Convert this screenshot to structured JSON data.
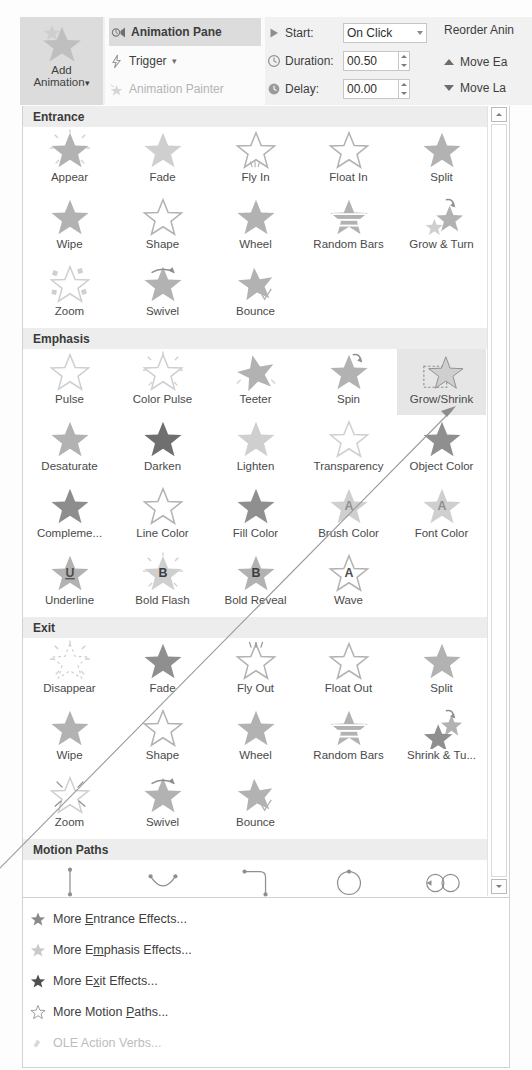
{
  "ribbon": {
    "add_animation": {
      "label_line1": "Add",
      "label_line2": "Animation",
      "icon": "add-animation-star-icon",
      "dropdown": "▾"
    },
    "commands": [
      {
        "label": "Animation Pane",
        "icon": "animation-pane-icon",
        "state": "active"
      },
      {
        "label": "Trigger",
        "icon": "trigger-lightning-icon",
        "dropdown": "▾",
        "state": "normal"
      },
      {
        "label": "Animation Painter",
        "icon": "animation-painter-icon",
        "state": "disabled"
      }
    ],
    "timing": {
      "start": {
        "label": "Start:",
        "value": "On Click",
        "icon": "play-triangle-icon",
        "dropdown": "▾"
      },
      "duration": {
        "label": "Duration:",
        "value": "00.50",
        "icon": "clock-icon"
      },
      "delay": {
        "label": "Delay:",
        "value": "00.00",
        "icon": "clock-delay-icon"
      }
    },
    "reorder": {
      "title": "Reorder Anin",
      "move_earlier": {
        "label": "Move Ea",
        "icon": "move-earlier-up-icon"
      },
      "move_later": {
        "label": "Move La",
        "icon": "move-later-down-icon"
      }
    }
  },
  "gallery": {
    "scrollbar": {
      "up_icon": "scroll-up-arrow-icon",
      "down_icon": "scroll-down-arrow-icon"
    },
    "sections": [
      {
        "title": "Entrance",
        "items": [
          {
            "label": "Appear",
            "icon": "star-appear-icon"
          },
          {
            "label": "Fade",
            "icon": "star-fade-icon"
          },
          {
            "label": "Fly In",
            "icon": "star-fly-in-icon"
          },
          {
            "label": "Float In",
            "icon": "star-float-in-icon"
          },
          {
            "label": "Split",
            "icon": "star-split-icon"
          },
          {
            "label": "Wipe",
            "icon": "star-wipe-icon"
          },
          {
            "label": "Shape",
            "icon": "star-shape-icon"
          },
          {
            "label": "Wheel",
            "icon": "star-wheel-icon"
          },
          {
            "label": "Random Bars",
            "icon": "star-random-bars-icon"
          },
          {
            "label": "Grow & Turn",
            "icon": "star-grow-turn-icon"
          },
          {
            "label": "Zoom",
            "icon": "star-zoom-icon"
          },
          {
            "label": "Swivel",
            "icon": "star-swivel-icon"
          },
          {
            "label": "Bounce",
            "icon": "star-bounce-icon"
          }
        ]
      },
      {
        "title": "Emphasis",
        "items": [
          {
            "label": "Pulse",
            "icon": "star-pulse-icon"
          },
          {
            "label": "Color Pulse",
            "icon": "star-color-pulse-icon"
          },
          {
            "label": "Teeter",
            "icon": "star-teeter-icon"
          },
          {
            "label": "Spin",
            "icon": "star-spin-icon"
          },
          {
            "label": "Grow/Shrink",
            "icon": "star-grow-shrink-icon",
            "selected": true
          },
          {
            "label": "Desaturate",
            "icon": "star-desaturate-icon"
          },
          {
            "label": "Darken",
            "icon": "star-darken-icon"
          },
          {
            "label": "Lighten",
            "icon": "star-lighten-icon"
          },
          {
            "label": "Transparency",
            "icon": "star-transparency-icon"
          },
          {
            "label": "Object Color",
            "icon": "star-object-color-icon"
          },
          {
            "label": "Compleme...",
            "icon": "star-complementary-color-icon"
          },
          {
            "label": "Line Color",
            "icon": "star-line-color-icon"
          },
          {
            "label": "Fill Color",
            "icon": "star-fill-color-icon"
          },
          {
            "label": "Brush Color",
            "icon": "star-brush-color-icon"
          },
          {
            "label": "Font Color",
            "icon": "star-font-color-icon"
          },
          {
            "label": "Underline",
            "icon": "star-underline-icon"
          },
          {
            "label": "Bold Flash",
            "icon": "star-bold-flash-icon"
          },
          {
            "label": "Bold Reveal",
            "icon": "star-bold-reveal-icon"
          },
          {
            "label": "Wave",
            "icon": "star-wave-icon"
          }
        ]
      },
      {
        "title": "Exit",
        "items": [
          {
            "label": "Disappear",
            "icon": "star-disappear-icon"
          },
          {
            "label": "Fade",
            "icon": "star-fade-out-icon"
          },
          {
            "label": "Fly Out",
            "icon": "star-fly-out-icon"
          },
          {
            "label": "Float Out",
            "icon": "star-float-out-icon"
          },
          {
            "label": "Split",
            "icon": "star-split-out-icon"
          },
          {
            "label": "Wipe",
            "icon": "star-wipe-out-icon"
          },
          {
            "label": "Shape",
            "icon": "star-shape-out-icon"
          },
          {
            "label": "Wheel",
            "icon": "star-wheel-out-icon"
          },
          {
            "label": "Random Bars",
            "icon": "star-random-bars-out-icon"
          },
          {
            "label": "Shrink & Tu...",
            "icon": "star-shrink-turn-icon"
          },
          {
            "label": "Zoom",
            "icon": "star-zoom-out-icon"
          },
          {
            "label": "Swivel",
            "icon": "star-swivel-out-icon"
          },
          {
            "label": "Bounce",
            "icon": "star-bounce-out-icon"
          }
        ]
      },
      {
        "title": "Motion Paths",
        "items": [
          {
            "label": "Lines",
            "icon": "path-lines-icon"
          },
          {
            "label": "Arcs",
            "icon": "path-arcs-icon"
          },
          {
            "label": "Turns",
            "icon": "path-turns-icon"
          },
          {
            "label": "Shapes",
            "icon": "path-shapes-icon"
          },
          {
            "label": "Loops",
            "icon": "path-loops-icon"
          }
        ]
      }
    ]
  },
  "menu": {
    "items": [
      {
        "label": "More Entrance Effects...",
        "icon": "star-solid-icon",
        "mnemonic": "E",
        "disabled": false
      },
      {
        "label": "More Emphasis Effects...",
        "icon": "star-faded-icon",
        "mnemonic": "m",
        "disabled": false
      },
      {
        "label": "More Exit Effects...",
        "icon": "star-dark-icon",
        "mnemonic": "x",
        "disabled": false
      },
      {
        "label": "More Motion Paths...",
        "icon": "star-outline-icon",
        "mnemonic": "P",
        "disabled": false
      },
      {
        "label": "OLE Action Verbs...",
        "icon": "ole-action-icon",
        "mnemonic": "",
        "disabled": true
      }
    ]
  },
  "annotation": {
    "type": "callout-arrow",
    "target": "Grow/Shrink",
    "color": "#9a9a9a"
  },
  "colors": {
    "ribbon_bg": "#f1f1f1",
    "active_highlight": "#dcdcdc",
    "section_header_bg": "#ededed",
    "selected_cell_bg": "#e6e6e6",
    "panel_border": "#d2d2d2",
    "text": "#3d3d3d",
    "disabled_text": "#bdbdbd",
    "star_gray": "#b0b0b0",
    "star_dark": "#8a8a8a"
  }
}
